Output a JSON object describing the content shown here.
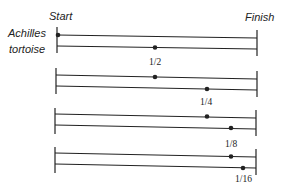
{
  "labels": {
    "start": "Start",
    "finish": "Finish",
    "runner_top": "Achilles",
    "runner_bottom": "tortoise"
  },
  "stages": [
    {
      "fraction_label": "1/2",
      "achilles_pos": 0.0,
      "tortoise_pos": 0.5
    },
    {
      "fraction_label": "1/4",
      "achilles_pos": 0.5,
      "tortoise_pos": 0.75
    },
    {
      "fraction_label": "1/8",
      "achilles_pos": 0.75,
      "tortoise_pos": 0.875
    },
    {
      "fraction_label": "1/16",
      "achilles_pos": 0.875,
      "tortoise_pos": 0.9375
    }
  ],
  "colors": {
    "ink": "#222222",
    "background": "#ffffff"
  }
}
